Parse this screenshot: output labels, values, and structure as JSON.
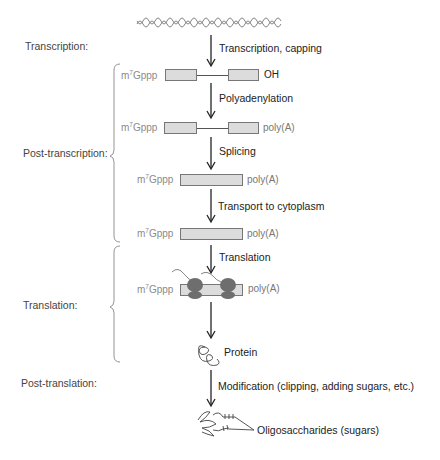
{
  "stages": {
    "transcription": "Transcription:",
    "post_transcription": "Post-transcription:",
    "translation": "Translation:",
    "post_translation": "Post-translation:"
  },
  "steps": {
    "transcription_capping": "Transcription, capping",
    "polyadenylation": "Polyadenylation",
    "splicing": "Splicing",
    "transport": "Transport to cytoplasm",
    "translation": "Translation",
    "modification": "Modification (clipping, adding sugars, etc.)"
  },
  "molecules": {
    "cap_prefix": "m",
    "cap_sup": "7",
    "cap_suffix": "Gppp",
    "oh_end": "OH",
    "polya_end": "poly(A)",
    "protein": "Protein",
    "oligosaccharides": "Oligosaccharides (sugars)"
  },
  "colors": {
    "exon_fill": "#dcdcdc",
    "ribosome": "#6e6e6e",
    "arrow": "#222222",
    "cap_text": "#8a8a8a"
  }
}
